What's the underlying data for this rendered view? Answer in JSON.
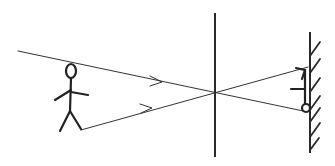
{
  "diagram": {
    "type": "pinhole-camera-ray-diagram",
    "colors": {
      "background": "#ffffff",
      "ink": "#222222"
    },
    "object": {
      "label": "stick-figure-upright",
      "head": {
        "cx": 71,
        "cy": 70,
        "rx": 5,
        "ry": 7
      },
      "body": [
        [
          71,
          77
        ],
        [
          70,
          110
        ]
      ],
      "arms": [
        [
          [
            71,
            90
          ],
          [
            54,
            100
          ]
        ],
        [
          [
            71,
            92
          ],
          [
            88,
            96
          ]
        ]
      ],
      "legs": [
        [
          [
            70,
            110
          ],
          [
            60,
            132
          ]
        ],
        [
          [
            70,
            110
          ],
          [
            81,
            130
          ]
        ]
      ]
    },
    "rays": [
      {
        "name": "ray-from-head",
        "from": [
          18,
          51
        ],
        "to": [
          308,
          112
        ],
        "arrow_at": [
          160,
          82
        ]
      },
      {
        "name": "ray-from-foot",
        "from": [
          81,
          130
        ],
        "to": [
          308,
          67
        ],
        "arrow_at": [
          150,
          108
        ]
      }
    ],
    "pinhole": {
      "x": 215,
      "y": 93
    },
    "barrier": {
      "x": 215,
      "y1": 13,
      "y2": 157
    },
    "screen": {
      "x": 310,
      "y1": 32,
      "y2": 153,
      "hatch_count": 7
    },
    "image": {
      "label": "stick-figure-inverted",
      "legs": [
        [
          [
            307,
            68
          ],
          [
            296,
            69
          ]
        ],
        [
          [
            307,
            68
          ],
          [
            302,
            78
          ]
        ]
      ],
      "body": [
        [
          305,
          70
        ],
        [
          305,
          104
        ]
      ],
      "arm": [
        [
          290,
          89
        ],
        [
          303,
          89
        ]
      ],
      "head": {
        "cx": 306,
        "cy": 108,
        "r": 4
      }
    }
  }
}
